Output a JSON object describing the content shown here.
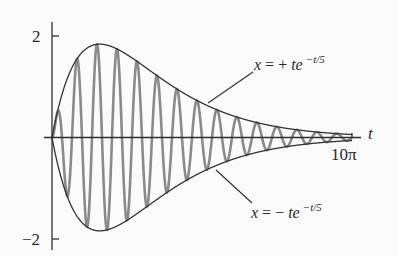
{
  "chart_data": {
    "type": "line",
    "title": "",
    "xlabel": "t",
    "ylabel": "",
    "xlim": [
      0,
      31.4159
    ],
    "ylim": [
      -2,
      2
    ],
    "grid": false,
    "legend": "none (direct labels with leader lines)",
    "x_ticks": [
      {
        "value": 31.4159,
        "label": "10π"
      }
    ],
    "y_ticks": [
      {
        "value": 2,
        "label": "2"
      },
      {
        "value": -2,
        "label": "−2"
      }
    ],
    "series": [
      {
        "name": "x = te^{-t/5} sin(3t)",
        "function": "t*exp(-t/5)*sin(3*t)",
        "color": "#8a8a8a",
        "role": "damped oscillation",
        "peak_envelope_value": 1.839,
        "peak_envelope_t": 5
      },
      {
        "name": "x = + te^{-t/5}",
        "function": "t*exp(-t/5)",
        "color": "#333333",
        "role": "upper envelope"
      },
      {
        "name": "x = − te^{-t/5}",
        "function": "-t*exp(-t/5)",
        "color": "#333333",
        "role": "lower envelope"
      }
    ],
    "annotations": [
      {
        "text": "x = + te^{−t/5}",
        "points_to": "upper envelope near t≈16.4"
      },
      {
        "text": "x = − te^{−t/5}",
        "points_to": "lower envelope near t≈17.2"
      }
    ]
  },
  "labels": {
    "y_top": "2",
    "y_bottom": "−2",
    "x_axis": "t",
    "x_end": "10π",
    "upper": {
      "lhs": "x",
      "eq": " = + ",
      "t": "te",
      "sup": "−t/5"
    },
    "lower": {
      "lhs": "x",
      "eq": " = − ",
      "t": "te",
      "sup": "−t/5"
    }
  },
  "colors": {
    "background": "#fbfbfb",
    "axis": "#2e2e2e",
    "envelope": "#333333",
    "wave": "#8a8a8a"
  }
}
